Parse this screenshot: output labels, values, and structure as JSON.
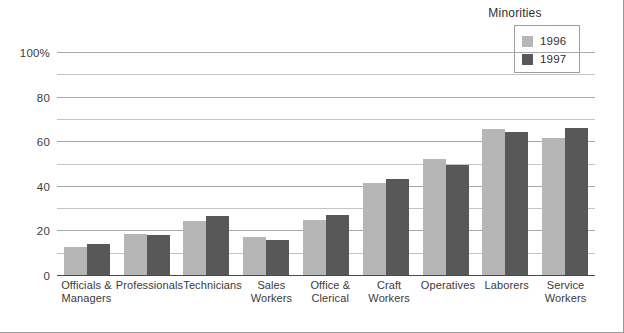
{
  "chart_data": {
    "type": "bar",
    "title": "",
    "xlabel": "",
    "ylabel": "",
    "ylim": [
      0,
      100
    ],
    "yticks": [
      0,
      20,
      40,
      60,
      80,
      100
    ],
    "ytick_labels": [
      "0",
      "20",
      "40",
      "60",
      "80",
      "100%"
    ],
    "minor_gridlines": [
      10,
      30,
      50,
      70,
      90
    ],
    "grid": true,
    "legend_title": "Minorities",
    "legend_position": "top-right",
    "categories": [
      "Officials &\nManagers",
      "Professionals",
      "Technicians",
      "Sales\nWorkers",
      "Office &\nClerical",
      "Craft\nWorkers",
      "Operatives",
      "Laborers",
      "Service\nWorkers"
    ],
    "series": [
      {
        "name": "1996",
        "color": "#b6b6b6",
        "values": [
          13,
          19,
          24.5,
          17.5,
          25,
          41.5,
          52.5,
          66,
          62
        ]
      },
      {
        "name": "1997",
        "color": "#585858",
        "values": [
          14.5,
          18.5,
          27,
          16,
          27.5,
          43.5,
          50,
          64.5,
          66.5
        ]
      }
    ]
  },
  "axis": {
    "tick_100": "100%",
    "tick_80": "80",
    "tick_60": "60",
    "tick_40": "40",
    "tick_20": "20",
    "tick_0": "0"
  },
  "legend": {
    "title": "Minorities",
    "entries": [
      {
        "label": "1996"
      },
      {
        "label": "1997"
      }
    ]
  },
  "xlabels": [
    {
      "line1": "Officials &",
      "line2": "Managers"
    },
    {
      "line1": "Professionals",
      "line2": ""
    },
    {
      "line1": "Technicians",
      "line2": ""
    },
    {
      "line1": "Sales",
      "line2": "Workers"
    },
    {
      "line1": "Office &",
      "line2": "Clerical"
    },
    {
      "line1": "Craft",
      "line2": "Workers"
    },
    {
      "line1": "Operatives",
      "line2": ""
    },
    {
      "line1": "Laborers",
      "line2": ""
    },
    {
      "line1": "Service",
      "line2": "Workers"
    }
  ]
}
